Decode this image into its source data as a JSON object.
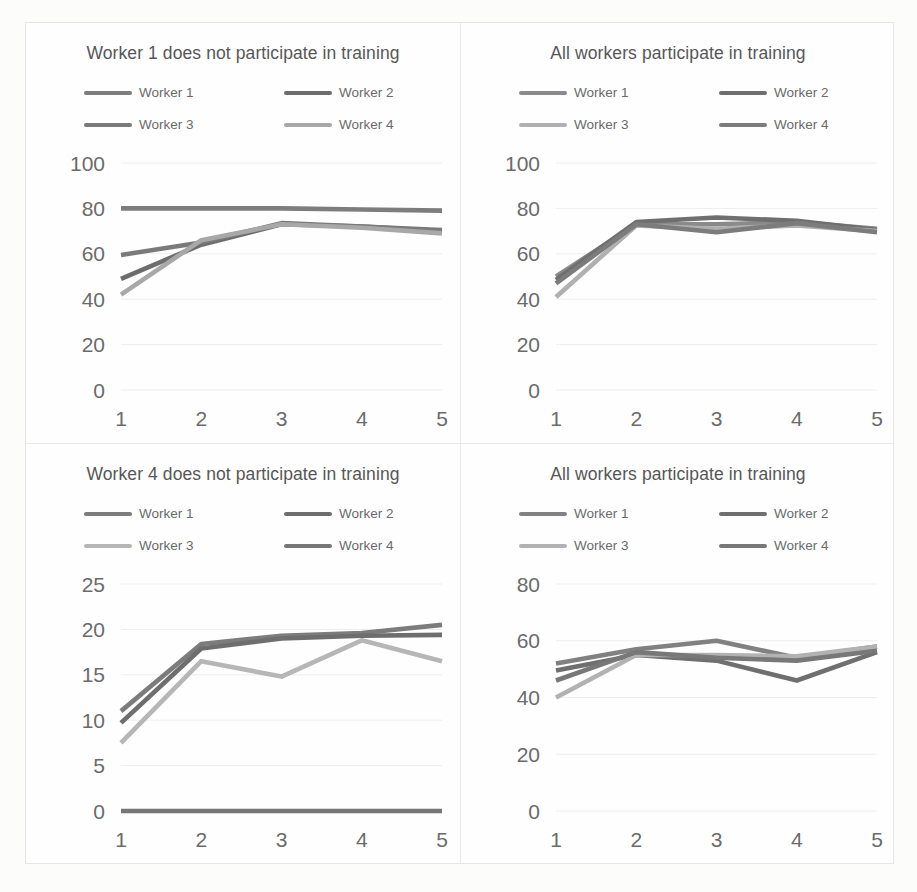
{
  "page": {
    "background_color": "#fcfcfa",
    "frame_color": "#e6e6e4",
    "divider_color": "#e8e8e6"
  },
  "series_colors": {
    "worker1": "#808080",
    "worker2": "#6e6e6e",
    "worker3": "#b4b4b4",
    "worker4": "#9a9a9a"
  },
  "charts": [
    {
      "id": "top-left",
      "title": "Worker 1 does not participate in training",
      "legend": [
        {
          "label": "Worker 1",
          "color": "#7d7d7d"
        },
        {
          "label": "Worker 2",
          "color": "#6d6d6d"
        },
        {
          "label": "Worker 3",
          "color": "#7a7a7a"
        },
        {
          "label": "Worker 4",
          "color": "#a8a8a8"
        }
      ],
      "chart_data": {
        "type": "line",
        "title": "Worker 1 does not participate in training",
        "xlabel": "",
        "ylabel": "",
        "x": [
          1,
          2,
          3,
          4,
          5
        ],
        "categories": [
          "1",
          "2",
          "3",
          "4",
          "5"
        ],
        "xticklabels": [
          "1",
          "2",
          "3",
          "4",
          "5"
        ],
        "yticklabels": [
          "0",
          "20",
          "40",
          "60",
          "80",
          "100"
        ],
        "yticks": [
          0,
          20,
          40,
          60,
          80,
          100
        ],
        "ylim": [
          0,
          100
        ],
        "grid": "horizontal",
        "legend_position": "top",
        "series": [
          {
            "name": "Worker 1",
            "color": "#7d7d7d",
            "values": [
              80,
              80,
              80,
              79.5,
              79
            ]
          },
          {
            "name": "Worker 2",
            "color": "#6d6d6d",
            "values": [
              49,
              64,
              73,
              72,
              70
            ]
          },
          {
            "name": "Worker 3",
            "color": "#7a7a7a",
            "values": [
              59.5,
              65,
              73.5,
              72,
              70.5
            ]
          },
          {
            "name": "Worker 4",
            "color": "#a8a8a8",
            "values": [
              42,
              66,
              73,
              71.5,
              69
            ]
          }
        ]
      }
    },
    {
      "id": "top-right",
      "title": "All workers participate in training",
      "legend": [
        {
          "label": "Worker 1",
          "color": "#8a8a8a"
        },
        {
          "label": "Worker 2",
          "color": "#6f6f6f"
        },
        {
          "label": "Worker 3",
          "color": "#b0b0b0"
        },
        {
          "label": "Worker 4",
          "color": "#7c7c7c"
        }
      ],
      "chart_data": {
        "type": "line",
        "title": "All workers participate in training",
        "xlabel": "",
        "ylabel": "",
        "x": [
          1,
          2,
          3,
          4,
          5
        ],
        "categories": [
          "1",
          "2",
          "3",
          "4",
          "5"
        ],
        "xticklabels": [
          "1",
          "2",
          "3",
          "4",
          "5"
        ],
        "yticklabels": [
          "0",
          "20",
          "40",
          "60",
          "80",
          "100"
        ],
        "yticks": [
          0,
          20,
          40,
          60,
          80,
          100
        ],
        "ylim": [
          0,
          100
        ],
        "grid": "horizontal",
        "legend_position": "top",
        "series": [
          {
            "name": "Worker 1",
            "color": "#8a8a8a",
            "values": [
              50,
              73,
              73,
              74,
              71
            ]
          },
          {
            "name": "Worker 2",
            "color": "#6f6f6f",
            "values": [
              48.5,
              74,
              76,
              74.5,
              70.5
            ]
          },
          {
            "name": "Worker 3",
            "color": "#b0b0b0",
            "values": [
              41,
              72.5,
              71,
              72.5,
              70
            ]
          },
          {
            "name": "Worker 4",
            "color": "#7c7c7c",
            "values": [
              47,
              73,
              69.5,
              73.5,
              69.5
            ]
          }
        ]
      }
    },
    {
      "id": "bottom-left",
      "title": "Worker 4 does not participate in training",
      "legend": [
        {
          "label": "Worker 1",
          "color": "#7c7c7c"
        },
        {
          "label": "Worker 2",
          "color": "#6e6e6e"
        },
        {
          "label": "Worker 3",
          "color": "#b6b6b6"
        },
        {
          "label": "Worker 4",
          "color": "#767676"
        }
      ],
      "chart_data": {
        "type": "line",
        "title": "Worker 4 does not participate in training",
        "xlabel": "",
        "ylabel": "",
        "x": [
          1,
          2,
          3,
          4,
          5
        ],
        "categories": [
          "1",
          "2",
          "3",
          "4",
          "5"
        ],
        "xticklabels": [
          "1",
          "2",
          "3",
          "4",
          "5"
        ],
        "yticklabels": [
          "0",
          "5",
          "10",
          "15",
          "20",
          "25"
        ],
        "yticks": [
          0,
          5,
          10,
          15,
          20,
          25
        ],
        "ylim": [
          0,
          25
        ],
        "grid": "horizontal",
        "legend_position": "top",
        "series": [
          {
            "name": "Worker 1",
            "color": "#7c7c7c",
            "values": [
              11,
              18.4,
              19.3,
              19.6,
              20.5
            ]
          },
          {
            "name": "Worker 2",
            "color": "#6e6e6e",
            "values": [
              9.7,
              17.9,
              19.0,
              19.3,
              19.4
            ]
          },
          {
            "name": "Worker 3",
            "color": "#b6b6b6",
            "values": [
              7.5,
              16.5,
              14.8,
              18.8,
              16.5
            ]
          },
          {
            "name": "Worker 4",
            "color": "#767676",
            "values": [
              0,
              0,
              0,
              0,
              0
            ]
          }
        ]
      }
    },
    {
      "id": "bottom-right",
      "title": "All workers participate in training",
      "legend": [
        {
          "label": "Worker 1",
          "color": "#818181"
        },
        {
          "label": "Worker 2",
          "color": "#6f6f6f"
        },
        {
          "label": "Worker 3",
          "color": "#b2b2b2"
        },
        {
          "label": "Worker 4",
          "color": "#787878"
        }
      ],
      "chart_data": {
        "type": "line",
        "title": "All workers participate in training",
        "xlabel": "",
        "ylabel": "",
        "x": [
          1,
          2,
          3,
          4,
          5
        ],
        "categories": [
          "1",
          "2",
          "3",
          "4",
          "5"
        ],
        "xticklabels": [
          "1",
          "2",
          "3",
          "4",
          "5"
        ],
        "yticklabels": [
          "0",
          "20",
          "40",
          "60",
          "80"
        ],
        "yticks": [
          0,
          20,
          40,
          60,
          80
        ],
        "ylim": [
          0,
          80
        ],
        "grid": "horizontal",
        "legend_position": "top",
        "series": [
          {
            "name": "Worker 1",
            "color": "#818181",
            "values": [
              52,
              57,
              60,
              54,
              58
            ]
          },
          {
            "name": "Worker 2",
            "color": "#6f6f6f",
            "values": [
              49.5,
              55,
              53,
              46,
              56
            ]
          },
          {
            "name": "Worker 3",
            "color": "#b2b2b2",
            "values": [
              40,
              55,
              55,
              54.5,
              58
            ]
          },
          {
            "name": "Worker 4",
            "color": "#787878",
            "values": [
              46,
              56,
              54,
              53,
              56.5
            ]
          }
        ]
      }
    }
  ]
}
